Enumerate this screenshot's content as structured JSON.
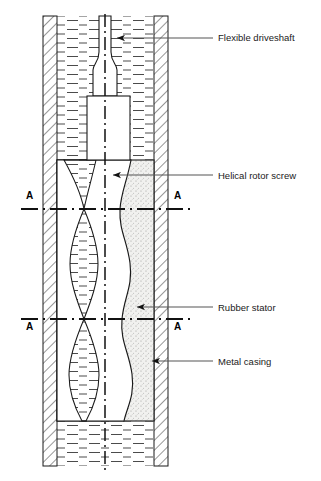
{
  "figure": {
    "type": "technical-cross-section-diagram",
    "background_color": "#ffffff",
    "line_color": "#1a1a1a",
    "leader_color": "#555555"
  },
  "callouts": [
    {
      "id": "flexible-driveshaft",
      "label": "Flexible driveshaft",
      "label_x": 218,
      "label_y": 41,
      "leader_x1": 213,
      "leader_y1": 38,
      "leader_x2": 117,
      "leader_y2": 38,
      "arrow": "left"
    },
    {
      "id": "helical-rotor-screw",
      "label": "Helical rotor screw",
      "label_x": 218,
      "label_y": 179,
      "leader_x1": 213,
      "leader_y1": 175,
      "leader_x2": 113,
      "leader_y2": 175,
      "arrow": "left"
    },
    {
      "id": "rubber-stator",
      "label": "Rubber stator",
      "label_x": 218,
      "label_y": 311,
      "leader_x1": 213,
      "leader_y1": 307,
      "leader_x2": 137,
      "leader_y2": 307,
      "arrow": "left"
    },
    {
      "id": "metal-casing",
      "label": "Metal casing",
      "label_x": 218,
      "label_y": 365,
      "leader_x1": 213,
      "leader_y1": 361,
      "leader_x2": 152,
      "leader_y2": 361,
      "arrow": "left"
    }
  ],
  "section_marks": [
    {
      "id": "section-a-upper-left",
      "label": "A",
      "x": 26,
      "y": 199,
      "line_y": 209,
      "anchor": "start"
    },
    {
      "id": "section-a-upper-right",
      "label": "A",
      "x": 174,
      "y": 199,
      "line_y": 209,
      "anchor": "start"
    },
    {
      "id": "section-a-lower-left",
      "label": "A",
      "x": 26,
      "y": 330,
      "line_y": 319,
      "anchor": "start"
    },
    {
      "id": "section-a-lower-right",
      "label": "A",
      "x": 174,
      "y": 330,
      "line_y": 319,
      "anchor": "start"
    }
  ],
  "geometry": {
    "casing_outer_left": 43,
    "casing_outer_right": 168,
    "casing_inner_left": 57,
    "casing_inner_right": 154,
    "casing_top": 16,
    "casing_bottom": 466,
    "centerline_x": 105,
    "centerline_top": 14,
    "centerline_bottom": 470,
    "stator_top": 160,
    "stator_bottom": 421,
    "driveshaft_top": 16,
    "driveshaft_neck_top": 70,
    "driveshaft_block_top": 96,
    "driveshaft_block_bottom": 160
  },
  "legend_notes": {
    "fluid_hatch": "horizontal dash fill (well fluid)",
    "casing_hatch": "45 degree diagonal hatch (metal)",
    "stator_fill": "stipple / dotted grey fill (elastomer)",
    "rotor_fill": "white"
  }
}
